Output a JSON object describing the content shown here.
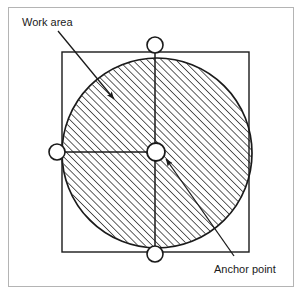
{
  "figure": {
    "type": "technical-diagram",
    "background_color": "#ffffff",
    "line_color": "#1a1a1a",
    "hatch_color": "#2b2b2b"
  },
  "border": {
    "name": "page-border",
    "x": 8,
    "y": 7,
    "width": 286,
    "height": 280,
    "stroke": "#b4b4b4",
    "stroke_width": 1
  },
  "labels": {
    "work_area": {
      "text": "Work area",
      "x": 22,
      "y": 26
    },
    "anchor_point": {
      "text": "Anchor point",
      "x": 214,
      "y": 273
    }
  },
  "leaders": [
    {
      "name": "work-area-leader",
      "label": "Work area",
      "from_x": 58,
      "from_y": 31,
      "to_x": 114,
      "to_y": 99
    },
    {
      "name": "anchor-point-leader",
      "label": "Anchor point",
      "from_x": 234,
      "from_y": 256,
      "to_x": 164,
      "to_y": 157
    }
  ],
  "square": {
    "name": "work-area-square",
    "x": 62,
    "y": 52,
    "width": 187,
    "height": 200,
    "stroke": "#1a1a1a",
    "stroke_width": 1.4
  },
  "circle": {
    "name": "work-area-circle",
    "cx": 157,
    "cy": 153,
    "r": 95,
    "stroke": "#1a1a1a",
    "stroke_width": 1.6,
    "fill": "hatched-45deg"
  },
  "axes": [
    {
      "name": "vertical-axis",
      "x1": 155,
      "y1": 45,
      "x2": 155,
      "y2": 255
    },
    {
      "name": "horizontal-axis",
      "x1": 57,
      "y1": 152,
      "x2": 157,
      "y2": 152
    }
  ],
  "markers": [
    {
      "name": "joint-marker-top",
      "cx": 155,
      "cy": 45,
      "r": 8,
      "fill": "#ffffff"
    },
    {
      "name": "joint-marker-left",
      "cx": 57,
      "cy": 152,
      "r": 8,
      "fill": "#ffffff"
    },
    {
      "name": "joint-marker-bottom",
      "cx": 155,
      "cy": 254,
      "r": 8,
      "fill": "#ffffff"
    },
    {
      "name": "anchor-point-marker",
      "cx": 156,
      "cy": 152,
      "r": 9,
      "fill": "#ffffff"
    }
  ]
}
